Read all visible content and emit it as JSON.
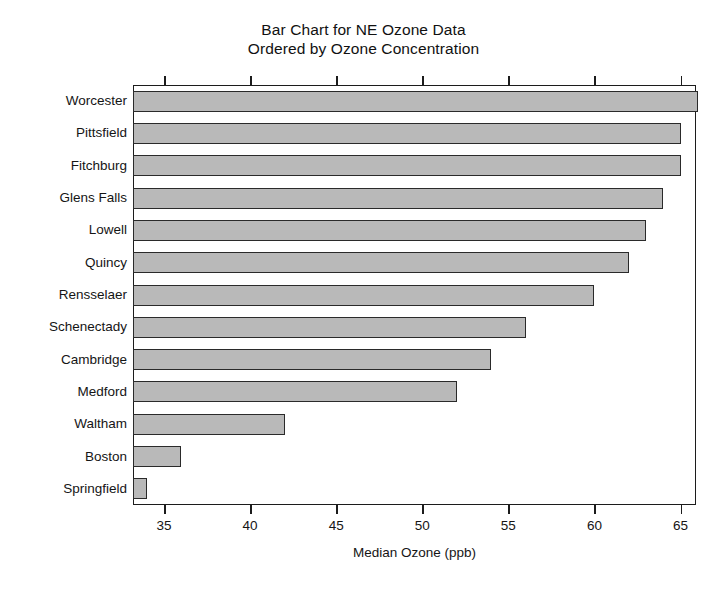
{
  "chart_data": {
    "type": "bar",
    "orientation": "horizontal",
    "title": "Bar Chart for NE Ozone Data",
    "subtitle": "Ordered by Ozone Concentration",
    "xlabel": "Median Ozone (ppb)",
    "ylabel": "",
    "categories": [
      "Worcester",
      "Pittsfield",
      "Fitchburg",
      "Glens Falls",
      "Lowell",
      "Quincy",
      "Rensselaer",
      "Schenectady",
      "Cambridge",
      "Medford",
      "Waltham",
      "Boston",
      "Springfield"
    ],
    "values": [
      66,
      65,
      65,
      64,
      63,
      62,
      60,
      56,
      54,
      52,
      42,
      36,
      34
    ],
    "xlim": [
      33.2,
      65.9
    ],
    "xticks": [
      35,
      40,
      45,
      50,
      55,
      60,
      65
    ],
    "xtick_labels": [
      "35",
      "40",
      "45",
      "50",
      "55",
      "60",
      "65"
    ],
    "grid": false,
    "legend": null,
    "bar_fill_color": "#b9b9b9",
    "bar_border_color": "#2a2a2a",
    "axis_color": "#1c1c1c",
    "background_color": "#ffffff"
  }
}
